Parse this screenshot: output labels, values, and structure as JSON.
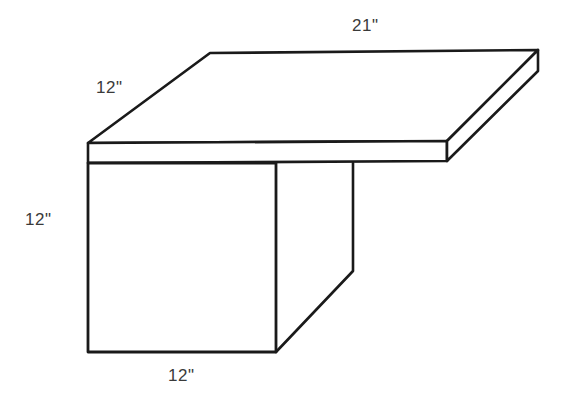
{
  "figure": {
    "background_color": "#ffffff",
    "stroke_color": "#1a1a1a",
    "label_color": "#3a3a3a",
    "labels": [
      {
        "name": "top-width",
        "text": "21\"",
        "meaning": "tabletop back edge length"
      },
      {
        "name": "top-depth",
        "text": "12\"",
        "meaning": "tabletop depth along left receding edge"
      },
      {
        "name": "height",
        "text": "12\"",
        "meaning": "vertical height of the left side panel"
      },
      {
        "name": "front-width",
        "text": "12\"",
        "meaning": "width of the front panel along the bottom"
      }
    ],
    "geometry": {
      "top_face": "210,53 538,50 447,141 88,143",
      "top_front_edge": "88,143 447,141",
      "top_front_thickness_bottom": "88,163 447,161",
      "top_right_thickness": "538,50 538,71 447,161 447,141",
      "left_panel": "88,163 88,352 276,352 276,163",
      "inner_panel_vertical": "353,163 353,271",
      "inner_panel_diagonal": "353,271 276,352"
    }
  }
}
